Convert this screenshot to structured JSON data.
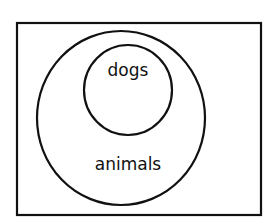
{
  "diagram": {
    "type": "venn-subset",
    "outer_set": {
      "label": "animals"
    },
    "inner_set": {
      "label": "dogs"
    },
    "relationship": "dogs is a subset of animals",
    "colors": {
      "stroke": "#111111",
      "background": "#ffffff"
    }
  }
}
